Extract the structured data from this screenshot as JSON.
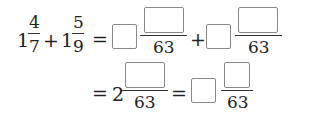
{
  "line1": {
    "term1": {
      "whole": "1",
      "num": "4",
      "den": "7"
    },
    "plus": "+",
    "term2": {
      "whole": "1",
      "num": "5",
      "den": "9"
    },
    "eq": "=",
    "ans1": {
      "whole_box": "",
      "num_box": "",
      "den": "63"
    },
    "plus2": "+",
    "ans2": {
      "whole_box": "",
      "num_box": "",
      "den": "63"
    }
  },
  "line2": {
    "eq": "=",
    "mixed": {
      "whole": "2",
      "num_box": "",
      "den": "63"
    },
    "eq2": "=",
    "final": {
      "whole_box": "",
      "num_box": "",
      "den": "63"
    }
  }
}
